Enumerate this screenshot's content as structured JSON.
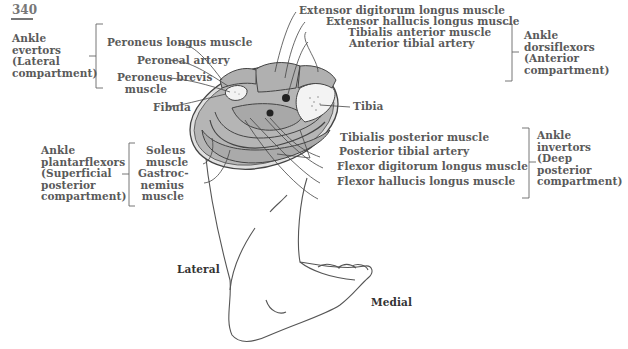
{
  "page_number": "340",
  "groups": {
    "lateral": {
      "title_lines": [
        "Ankle",
        "evertors",
        "(Lateral",
        "compartment)"
      ]
    },
    "anterior": {
      "title_lines": [
        "Ankle",
        "dorsiflexors",
        "(Anterior",
        "compartment)"
      ]
    },
    "superficial_posterior": {
      "title_lines": [
        "Ankle",
        "plantarflexors",
        "(Superficial",
        "posterior",
        "compartment)"
      ]
    },
    "deep_posterior": {
      "title_lines": [
        "Ankle",
        "invertors",
        "(Deep",
        "posterior",
        "compartment)"
      ]
    }
  },
  "labels": {
    "peroneus_longus": "Peroneus longus muscle",
    "peroneal_artery": "Peroneal artery",
    "peroneus_brevis_1": "Peroneus brevis",
    "peroneus_brevis_2": "muscle",
    "fibula": "Fibula",
    "extensor_digitorum": "Extensor digitorum longus muscle",
    "extensor_hallucis": "Extensor hallucis longus muscle",
    "tibialis_anterior": "Tibialis anterior muscle",
    "anterior_tibial_artery": "Anterior tibial artery",
    "tibia": "Tibia",
    "soleus_1": "Soleus",
    "soleus_2": "muscle",
    "gastroc_1": "Gastroc-",
    "gastroc_2": "nemius",
    "gastroc_3": "muscle",
    "tibialis_posterior": "Tibialis posterior muscle",
    "posterior_tibial_artery": "Posterior tibial artery",
    "flexor_digitorum": "Flexor digitorum longus muscle",
    "flexor_hallucis": "Flexor hallucis longus muscle"
  },
  "orientation": {
    "lateral": "Lateral",
    "medial": "Medial"
  },
  "colors": {
    "muscle_fill": "#b3b3b3",
    "outline": "#444444",
    "text": "#5a5a5a",
    "bone_fill": "#f2f2f2"
  }
}
